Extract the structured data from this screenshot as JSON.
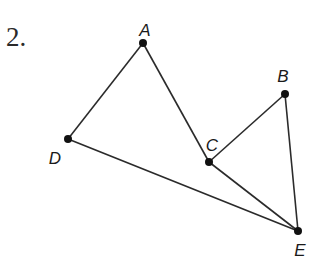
{
  "problem": {
    "number": "2."
  },
  "colors": {
    "line": "#2b2b2b",
    "point": "#111111",
    "background": "#ffffff"
  },
  "points": [
    {
      "id": "A",
      "label": "A",
      "x": 143,
      "y": 43,
      "lx": 145,
      "ly": 36
    },
    {
      "id": "B",
      "label": "B",
      "x": 285,
      "y": 94,
      "lx": 283,
      "ly": 82
    },
    {
      "id": "C",
      "label": "C",
      "x": 209,
      "y": 162,
      "lx": 212,
      "ly": 151
    },
    {
      "id": "D",
      "label": "D",
      "x": 68,
      "y": 139,
      "lx": 55,
      "ly": 164
    },
    {
      "id": "E",
      "label": "E",
      "x": 298,
      "y": 231,
      "lx": 300,
      "ly": 256
    }
  ],
  "segments": [
    {
      "from": "A",
      "to": "D"
    },
    {
      "from": "A",
      "to": "C"
    },
    {
      "from": "D",
      "to": "E"
    },
    {
      "from": "C",
      "to": "B"
    },
    {
      "from": "C",
      "to": "E"
    },
    {
      "from": "B",
      "to": "E"
    }
  ]
}
